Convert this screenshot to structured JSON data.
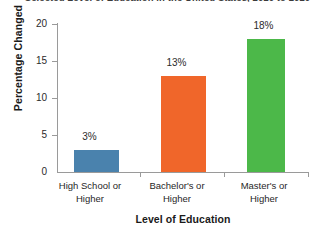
{
  "chart_data": {
    "type": "bar",
    "title": "Selected Level of Education in the United States, 2010 to 2020",
    "xlabel": "Level of Education",
    "ylabel": "Percentage Changed",
    "categories": [
      "High School or Higher",
      "Bachelor's or Higher",
      "Master's or Higher"
    ],
    "category_lines": [
      [
        "High School or",
        "Higher"
      ],
      [
        "Bachelor's or",
        "Higher"
      ],
      [
        "Master's or",
        "Higher"
      ]
    ],
    "values": [
      3,
      13,
      18
    ],
    "value_labels": [
      "3%",
      "13%",
      "18%"
    ],
    "bar_colors": [
      "#4a82ad",
      "#f0662a",
      "#4cb849"
    ],
    "ylim": [
      0,
      20
    ],
    "yticks": [
      0,
      5,
      10,
      15,
      20
    ],
    "ytick_labels": [
      "0",
      "5",
      "10",
      "15",
      "20"
    ],
    "grid": false,
    "legend": false,
    "legend_position": "none"
  }
}
